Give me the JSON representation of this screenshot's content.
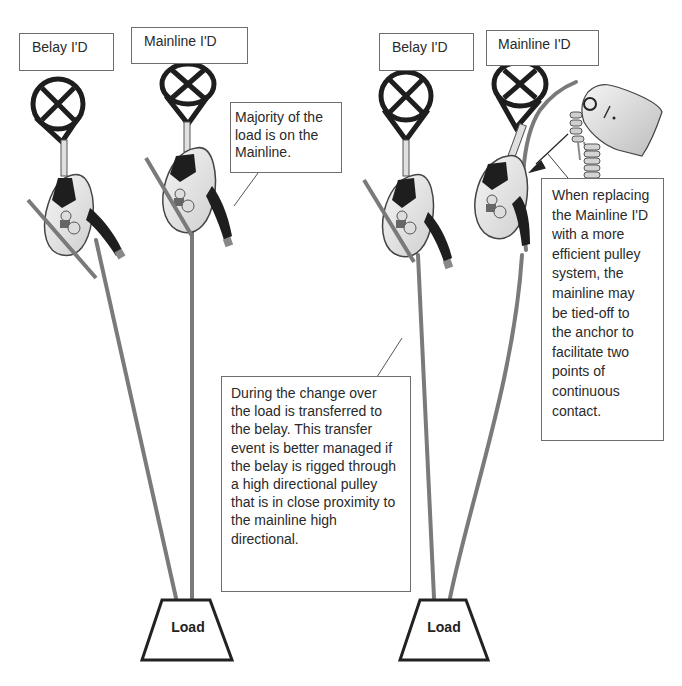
{
  "figure": {
    "left_panel": {
      "belay_label": "Belay I'D",
      "mainline_label": "Mainline  I'D",
      "note": "Majority of the\nload is on the\nMainline.",
      "load_label": "Load"
    },
    "right_panel": {
      "belay_label": "Belay I'D",
      "mainline_label": "Mainline I'D",
      "note_top": "When replacing\nthe Mainline I'D\nwith a more\nefficient pulley\nsystem, the\nmainline may\nbe tied-off to\nthe anchor to\nfacilitate two\npoints of\ncontinuous\ncontact.",
      "load_label": "Load"
    },
    "center_note": "During the change over\nthe load is transferred to\nthe belay.  This transfer\nevent is better managed if\nthe belay is rigged through\na high directional pulley\nthat is in close proximity to\nthe mainline high\ndirectional.",
    "colors": {
      "rope": "#7a7a7a",
      "device_dark": "#1e1e1e",
      "device_body": "#e8e8e8",
      "box_border": "#6e6e6e"
    },
    "icons": {
      "anchor_sling": "anchor-sling-icon",
      "descender": "descender-device-icon",
      "rope_grab": "rope-grab-icon",
      "load_weight": "load-weight-icon"
    }
  }
}
